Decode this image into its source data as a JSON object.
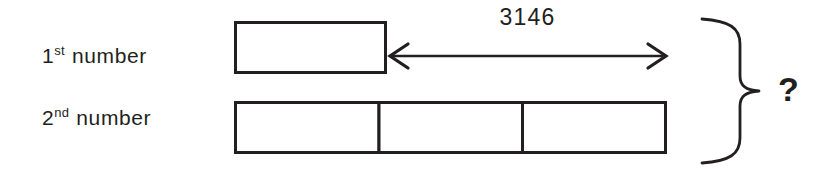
{
  "diagram": {
    "type": "bar-model",
    "background_color": "#ffffff",
    "stroke_color": "#231f20",
    "rows": [
      {
        "label_number": "1",
        "label_ordinal": "st",
        "label_word": "number",
        "segments": 1
      },
      {
        "label_number": "2",
        "label_ordinal": "nd",
        "label_word": "number",
        "segments": 3
      }
    ],
    "difference_annotation": {
      "value": "3146",
      "arrow": "double-headed-horizontal"
    },
    "total_annotation": {
      "brace": "right-curly-brace",
      "value": "?"
    }
  }
}
